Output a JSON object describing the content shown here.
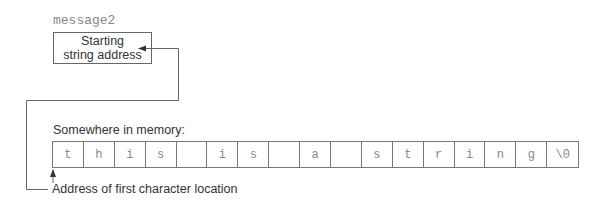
{
  "diagram": {
    "pointer": {
      "variable_name": "message2",
      "box_line1": "Starting",
      "box_line2": "string address"
    },
    "memory": {
      "label": "Somewhere in memory:",
      "cells": [
        "t",
        "h",
        "i",
        "s",
        "",
        "i",
        "s",
        "",
        "a",
        "",
        "s",
        "t",
        "r",
        "i",
        "n",
        "g",
        "\\0"
      ]
    },
    "annotation": {
      "first_char_label": "Address of first character location"
    },
    "colors": {
      "lines": "#666666",
      "cell_text": "#888888",
      "label_text": "#333333"
    }
  }
}
